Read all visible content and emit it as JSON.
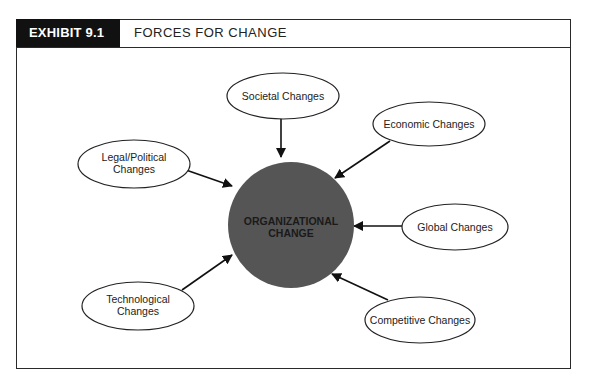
{
  "header": {
    "exhibit_label": "EXHIBIT 9.1",
    "title": "FORCES FOR CHANGE"
  },
  "diagram": {
    "center": {
      "line1": "ORGANIZATIONAL",
      "line2": "CHANGE",
      "fill": "#555555"
    },
    "nodes": [
      {
        "id": "societal",
        "line1": "Societal Changes",
        "line2": ""
      },
      {
        "id": "economic",
        "line1": "Economic Changes",
        "line2": ""
      },
      {
        "id": "legal",
        "line1": "Legal/Political",
        "line2": "Changes"
      },
      {
        "id": "global",
        "line1": "Global Changes",
        "line2": ""
      },
      {
        "id": "technological",
        "line1": "Technological",
        "line2": "Changes"
      },
      {
        "id": "competitive",
        "line1": "Competitive Changes",
        "line2": ""
      }
    ]
  }
}
